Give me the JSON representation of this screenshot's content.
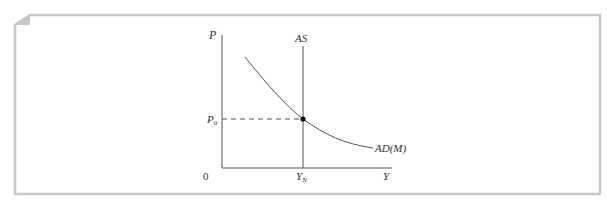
{
  "figure": {
    "frame_color": "#c8c8c8",
    "line_color": "#444444"
  },
  "axes": {
    "y_label": "P",
    "x_label": "Y",
    "origin_label": "0"
  },
  "curves": {
    "as_label": "AS",
    "ad_label": "AD(M)"
  },
  "equilibrium": {
    "price_label_main": "P",
    "price_label_sub": "0",
    "output_label_main": "Y",
    "output_label_sub": "N"
  }
}
